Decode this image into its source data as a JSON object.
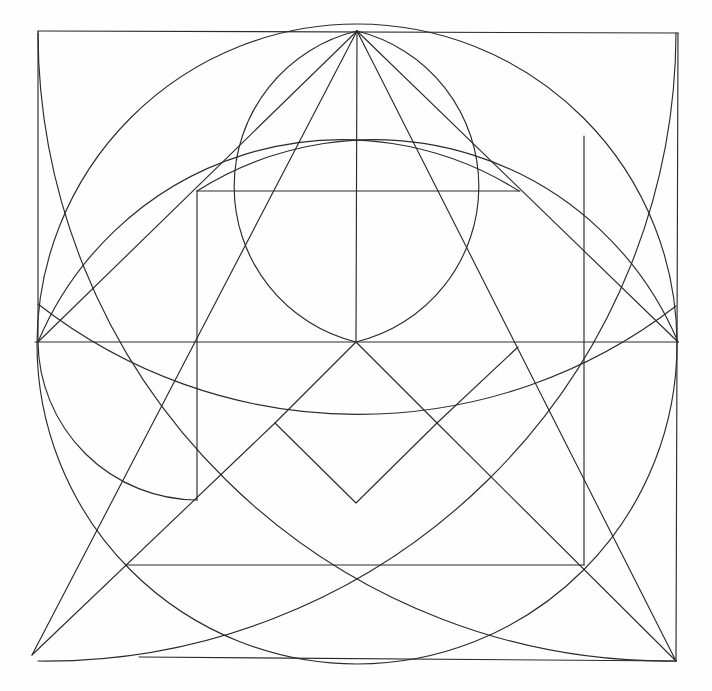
{
  "figure": {
    "canvas": {
      "width": 712,
      "height": 691,
      "background": "#fefefe"
    },
    "style": {
      "stroke_color": "#2b2b2b",
      "stroke_width": 1.15,
      "fill": "none"
    },
    "key_points": {
      "square_top_left": [
        38,
        31
      ],
      "square_top_right": [
        678,
        33
      ],
      "square_bottom_right": [
        676,
        661
      ],
      "square_bottom_left_implied": [
        38,
        661
      ],
      "square_top_center": [
        357,
        31
      ],
      "center": [
        356,
        342
      ],
      "circle_center": [
        357,
        346
      ],
      "circle_radius": 320,
      "diamond_bottom": [
        356,
        503
      ],
      "diagonal_overshoot_end": [
        32,
        655
      ]
    },
    "elements": [
      {
        "name": "square-outline",
        "type": "polyline",
        "points": "38,31 678,33 676,661 138,657"
      },
      {
        "name": "inscribed-circle",
        "type": "circle",
        "cx": 357,
        "cy": 346,
        "r": 320
      },
      {
        "name": "arc-top-left-corner",
        "type": "arc",
        "from": [
          38,
          31
        ],
        "to": [
          676,
          33
        ],
        "sweep": "down"
      },
      {
        "name": "arc-top-right-corner",
        "type": "arc",
        "from": [
          678,
          33
        ],
        "to": [
          38,
          33
        ],
        "sweep": "down"
      },
      {
        "name": "arc-center-lens-left",
        "type": "arc",
        "from": [
          197,
          191
        ],
        "to": [
          356,
          342
        ]
      },
      {
        "name": "arc-center-lens-right",
        "type": "arc",
        "from": [
          519,
          191
        ],
        "to": [
          356,
          342
        ]
      },
      {
        "name": "arc-small-left",
        "type": "arc",
        "from": [
          38,
          342
        ],
        "to": [
          197,
          500
        ]
      },
      {
        "name": "arc-wide-low",
        "type": "arc",
        "from": [
          38,
          342
        ],
        "to": [
          676,
          342
        ]
      },
      {
        "name": "horizontal-mid",
        "type": "line",
        "from": [
          35,
          342
        ],
        "to": [
          678,
          342
        ]
      },
      {
        "name": "horizontal-upper",
        "type": "line",
        "from": [
          197,
          191
        ],
        "to": [
          519,
          191
        ]
      },
      {
        "name": "horizontal-lower",
        "type": "line",
        "from": [
          127,
          565
        ],
        "to": [
          584,
          565
        ]
      },
      {
        "name": "vertical-center",
        "type": "line",
        "from": [
          357,
          31
        ],
        "to": [
          356,
          342
        ]
      },
      {
        "name": "vertical-left",
        "type": "line",
        "from": [
          197,
          191
        ],
        "to": [
          197,
          500
        ]
      },
      {
        "name": "vertical-right",
        "type": "line",
        "from": [
          584,
          136
        ],
        "to": [
          584,
          565
        ]
      },
      {
        "name": "diagonal-main-descending",
        "type": "line",
        "from": [
          357,
          31
        ],
        "to": [
          676,
          661
        ]
      },
      {
        "name": "diagonal-main-ascending",
        "type": "line",
        "from": [
          357,
          31
        ],
        "to": [
          32,
          655
        ]
      },
      {
        "name": "diagonal-left-to-center",
        "type": "line",
        "from": [
          38,
          342
        ],
        "to": [
          357,
          31
        ]
      },
      {
        "name": "diagonal-right-to-center",
        "type": "line",
        "from": [
          678,
          342
        ],
        "to": [
          357,
          31
        ]
      },
      {
        "name": "diamond-left-edge",
        "type": "line",
        "from": [
          356,
          342
        ],
        "to": [
          275,
          423
        ]
      },
      {
        "name": "diamond-bottom-left-edge",
        "type": "line",
        "from": [
          275,
          423
        ],
        "to": [
          356,
          503
        ]
      },
      {
        "name": "diamond-bottom-right-edge",
        "type": "line",
        "from": [
          356,
          503
        ],
        "to": [
          437,
          423
        ]
      },
      {
        "name": "diamond-right-edge",
        "type": "line",
        "from": [
          437,
          423
        ],
        "to": [
          356,
          342
        ]
      },
      {
        "name": "diagonal-short-upper-right",
        "type": "line",
        "from": [
          437,
          423
        ],
        "to": [
          518,
          347
        ]
      },
      {
        "name": "diagonal-lower-left-long",
        "type": "line",
        "from": [
          275,
          423
        ],
        "to": [
          32,
          655
        ]
      },
      {
        "name": "diagonal-lower-right-long",
        "type": "line",
        "from": [
          437,
          423
        ],
        "to": [
          676,
          661
        ]
      }
    ],
    "labels": {
      "caption": ""
    }
  }
}
